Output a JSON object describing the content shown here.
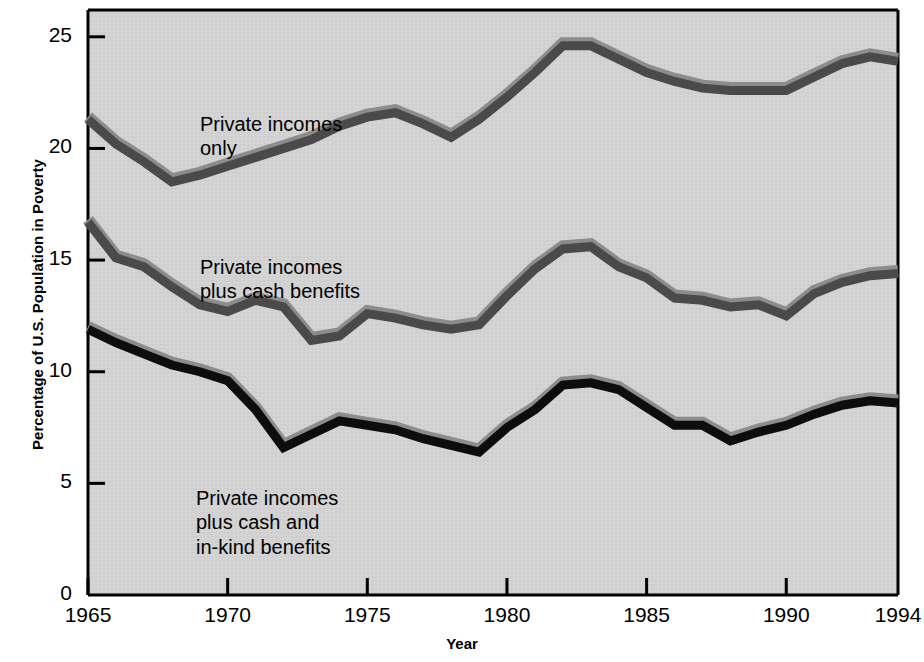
{
  "chart_data": {
    "type": "line",
    "title": "",
    "xlabel": "Year",
    "ylabel": "Percentage of U.S. Population in Poverty",
    "xlim": [
      1965,
      1994
    ],
    "ylim": [
      0,
      26.2
    ],
    "xticks": [
      1965,
      1970,
      1975,
      1980,
      1985,
      1990,
      1994
    ],
    "xticklabels": [
      "1965",
      "1970",
      "1975",
      "1980",
      "1985",
      "1990",
      "1994"
    ],
    "yticks": [
      0,
      5,
      10,
      15,
      20,
      25
    ],
    "yticklabels": [
      "0",
      "5",
      "10",
      "15",
      "20",
      "25"
    ],
    "grid": false,
    "legend": "inline-annotations",
    "plot_background": "#d2d2d2",
    "x": [
      1965,
      1966,
      1967,
      1968,
      1969,
      1970,
      1971,
      1972,
      1973,
      1974,
      1975,
      1976,
      1977,
      1978,
      1979,
      1980,
      1981,
      1982,
      1983,
      1984,
      1985,
      1986,
      1987,
      1988,
      1989,
      1990,
      1991,
      1992,
      1993,
      1994
    ],
    "series": [
      {
        "name": "Private incomes only",
        "color": "#4a4a4a",
        "highlight": "#8c8c8c",
        "label_lines": [
          "Private incomes",
          "only"
        ],
        "values": [
          21.3,
          20.2,
          19.4,
          18.5,
          18.8,
          19.2,
          19.6,
          20.0,
          20.4,
          21.0,
          21.4,
          21.6,
          21.1,
          20.5,
          21.3,
          22.3,
          23.4,
          24.6,
          24.6,
          24.0,
          23.4,
          23.0,
          22.7,
          22.6,
          22.6,
          22.6,
          23.2,
          23.8,
          24.1,
          23.9
        ]
      },
      {
        "name": "Private incomes plus cash benefits",
        "color": "#4a4a4a",
        "highlight": "#8c8c8c",
        "label_lines": [
          "Private incomes",
          "plus cash benefits"
        ],
        "values": [
          16.7,
          15.1,
          14.7,
          13.8,
          13.0,
          12.7,
          13.2,
          12.9,
          11.4,
          11.6,
          12.6,
          12.4,
          12.1,
          11.9,
          12.1,
          13.4,
          14.6,
          15.5,
          15.6,
          14.7,
          14.2,
          13.3,
          13.2,
          12.9,
          13.0,
          12.5,
          13.5,
          14.0,
          14.3,
          14.4
        ]
      },
      {
        "name": "Private incomes plus cash and in-kind benefits",
        "color": "#0d0d0d",
        "highlight": "#8c8c8c",
        "label_lines": [
          "Private incomes",
          "plus cash and",
          "in-kind benefits"
        ],
        "values": [
          11.9,
          11.3,
          10.8,
          10.3,
          10.0,
          9.6,
          8.3,
          6.6,
          7.2,
          7.8,
          7.6,
          7.4,
          7.0,
          6.7,
          6.4,
          7.5,
          8.3,
          9.4,
          9.5,
          9.2,
          8.4,
          7.6,
          7.6,
          6.9,
          7.3,
          7.6,
          8.1,
          8.5,
          8.7,
          8.6
        ]
      }
    ],
    "annotations": [
      {
        "text": "Private incomes\nonly",
        "x_px": 200,
        "y_px": 112
      },
      {
        "text": "Private incomes\nplus cash benefits",
        "x_px": 200,
        "y_px": 255
      },
      {
        "text": "Private incomes\nplus cash and\nin-kind benefits",
        "x_px": 196,
        "y_px": 486
      }
    ]
  },
  "axes": {
    "x_title": "Year",
    "y_title": "Percentage of U.S. Population in Poverty"
  }
}
